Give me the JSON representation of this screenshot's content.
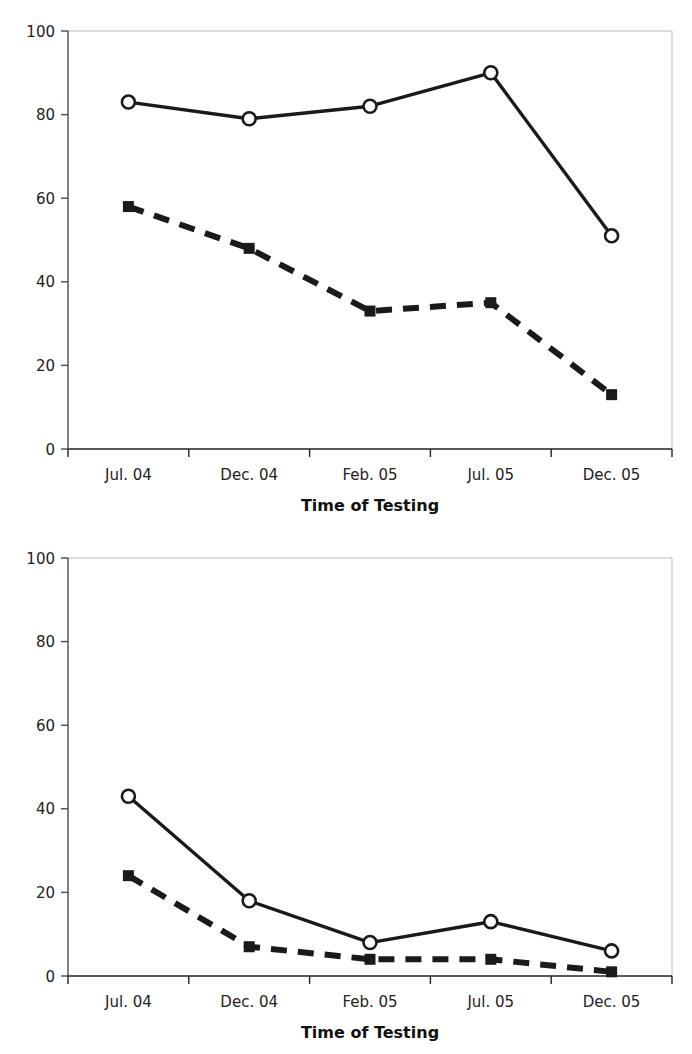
{
  "figure": {
    "background": "#ffffff",
    "panel_count": 2
  },
  "chart_data": [
    {
      "type": "line",
      "title": "",
      "xlabel": "Time of Testing",
      "ylabel": "",
      "categories": [
        "Jul. 04",
        "Dec. 04",
        "Feb. 05",
        "Jul. 05",
        "Dec. 05"
      ],
      "yticks": [
        0,
        20,
        40,
        60,
        80,
        100
      ],
      "ylim": [
        0,
        100
      ],
      "grid": false,
      "legend": "none",
      "series": [
        {
          "name": "open-circle-solid-line",
          "marker": "open-circle",
          "line_style": "solid",
          "color": "#1a1a1a",
          "values": [
            83,
            79,
            82,
            90,
            51
          ]
        },
        {
          "name": "filled-square-dashed-line",
          "marker": "filled-square",
          "line_style": "dashed",
          "color": "#1a1a1a",
          "values": [
            58,
            48,
            33,
            35,
            13
          ]
        }
      ]
    },
    {
      "type": "line",
      "title": "",
      "xlabel": "Time of Testing",
      "ylabel": "",
      "categories": [
        "Jul. 04",
        "Dec. 04",
        "Feb. 05",
        "Jul. 05",
        "Dec. 05"
      ],
      "yticks": [
        0,
        20,
        40,
        60,
        80,
        100
      ],
      "ylim": [
        0,
        100
      ],
      "grid": false,
      "legend": "none",
      "series": [
        {
          "name": "open-circle-solid-line",
          "marker": "open-circle",
          "line_style": "solid",
          "color": "#1a1a1a",
          "values": [
            43,
            18,
            8,
            13,
            6
          ]
        },
        {
          "name": "filled-square-dashed-line",
          "marker": "filled-square",
          "line_style": "dashed",
          "color": "#1a1a1a",
          "values": [
            24,
            7,
            4,
            4,
            1
          ]
        }
      ]
    }
  ],
  "panels": [
    {
      "id": "chart-top",
      "axis_title": "Time of Testing",
      "ytick_labels": [
        "100",
        "80",
        "60",
        "40",
        "20",
        "0"
      ],
      "xtick_labels": [
        "Jul. 04",
        "Dec. 04",
        "Feb. 05",
        "Jul. 05",
        "Dec. 05"
      ]
    },
    {
      "id": "chart-bottom",
      "axis_title": "Time of Testing",
      "ytick_labels": [
        "100",
        "80",
        "60",
        "40",
        "20",
        "0"
      ],
      "xtick_labels": [
        "Jul. 04",
        "Dec. 04",
        "Feb. 05",
        "Jul. 05",
        "Dec. 05"
      ]
    }
  ]
}
